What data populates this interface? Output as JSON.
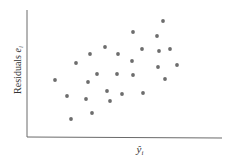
{
  "chart_data": {
    "type": "scatter",
    "title": "",
    "xlabel": "ŷ_i",
    "ylabel": "Residuals e_i",
    "grid": false,
    "legend": null,
    "ticks": false,
    "points": [
      {
        "x": 55,
        "y": 80
      },
      {
        "x": 67,
        "y": 96
      },
      {
        "x": 71,
        "y": 119
      },
      {
        "x": 76,
        "y": 63
      },
      {
        "x": 86,
        "y": 99
      },
      {
        "x": 88,
        "y": 82
      },
      {
        "x": 90,
        "y": 54
      },
      {
        "x": 92,
        "y": 113
      },
      {
        "x": 97,
        "y": 74
      },
      {
        "x": 105,
        "y": 47
      },
      {
        "x": 107,
        "y": 91
      },
      {
        "x": 110,
        "y": 101
      },
      {
        "x": 117,
        "y": 74
      },
      {
        "x": 118,
        "y": 54
      },
      {
        "x": 122,
        "y": 94
      },
      {
        "x": 132,
        "y": 61
      },
      {
        "x": 133,
        "y": 32
      },
      {
        "x": 133,
        "y": 75
      },
      {
        "x": 142,
        "y": 49
      },
      {
        "x": 143,
        "y": 93
      },
      {
        "x": 157,
        "y": 36
      },
      {
        "x": 158,
        "y": 67
      },
      {
        "x": 159,
        "y": 51
      },
      {
        "x": 163,
        "y": 21
      },
      {
        "x": 165,
        "y": 79
      },
      {
        "x": 170,
        "y": 49
      },
      {
        "x": 177,
        "y": 65
      }
    ]
  },
  "labels": {
    "y_axis": "Residuals ",
    "y_axis_var": "e",
    "y_axis_sub": "i",
    "x_axis": "ŷ",
    "x_axis_sub": "i"
  }
}
